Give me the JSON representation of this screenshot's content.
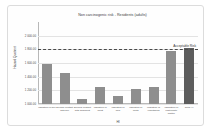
{
  "chart_data": {
    "type": "bar",
    "title": "Non carcinogenic risk - Residents (adults)",
    "xlabel": "HI",
    "ylabel": "Hazard Quotient",
    "categories": [
      "Ingestion of soil",
      "Dermal contact with soil",
      "Dermal contact with sediment",
      "Ingestion of meat",
      "Ingestion of milk",
      "Ingestion of fruits",
      "Ingestion of vegetables",
      "Inhalation of particulate matter",
      "Total HI"
    ],
    "values": [
      1.58,
      1.46,
      1.08,
      1.25,
      1.11,
      1.22,
      1.25,
      1.78,
      1.82
    ],
    "ylim": [
      1.0,
      2.2
    ],
    "yticks": [
      1.0,
      1.2,
      1.4,
      1.6,
      1.8,
      2.0
    ],
    "ytick_labels": [
      "1 000.00",
      "1 200.00",
      "1 400.00",
      "1 600.00",
      "1 800.00",
      "2 000.00"
    ],
    "grid": true,
    "legend": false,
    "annotations": [
      {
        "text": "Acceptable Risk",
        "y": 1.8,
        "style": "dashed-threshold"
      }
    ],
    "series_colors": {
      "bar": "#8e8e8e",
      "total": "#5d5d5d"
    }
  }
}
